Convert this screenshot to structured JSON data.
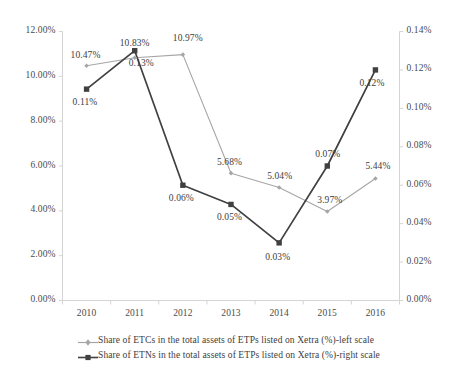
{
  "chart_data": {
    "type": "line",
    "title": "",
    "xlabel": "",
    "ylabel": "",
    "categories": [
      "2010",
      "2011",
      "2012",
      "2013",
      "2014",
      "2015",
      "2016"
    ],
    "grid": false,
    "legend_position": "bottom",
    "axes": {
      "left": {
        "label": "left scale",
        "ylim": [
          0.0,
          12.0
        ],
        "tick_step": 2.0,
        "ticks": [
          "0.00%",
          "2.00%",
          "4.00%",
          "6.00%",
          "8.00%",
          "10.00%",
          "12.00%"
        ]
      },
      "right": {
        "label": "right scale",
        "ylim": [
          0.0,
          0.14
        ],
        "tick_step": 0.02,
        "ticks": [
          "0.00%",
          "0.02%",
          "0.04%",
          "0.06%",
          "0.08%",
          "0.10%",
          "0.12%",
          "0.14%"
        ]
      }
    },
    "series": [
      {
        "name": "Share of ETCs in the total assets of ETPs listed on Xetra (%)-left scale",
        "axis": "left",
        "color": "#a6a6a6",
        "marker": "diamond",
        "values": [
          10.47,
          10.83,
          10.97,
          5.68,
          5.04,
          3.97,
          5.44
        ],
        "labels": [
          "10.47%",
          "10.83%",
          "10.97%",
          "5.68%",
          "5.04%",
          "3.97%",
          "5.44%"
        ]
      },
      {
        "name": "Share of ETNs in the total assets of ETPs listed on Xetra (%)-right scale",
        "axis": "right",
        "color": "#404040",
        "marker": "square",
        "values": [
          0.11,
          0.13,
          0.06,
          0.05,
          0.03,
          0.07,
          0.12
        ],
        "labels": [
          "0.11%",
          "0.13%",
          "0.06%",
          "0.05%",
          "0.03%",
          "0.07%",
          "0.12%"
        ]
      }
    ]
  },
  "legend": {
    "items": [
      {
        "label": "Share of ETCs in the total assets of ETPs listed on Xetra (%)-left scale",
        "color": "#a6a6a6",
        "marker": "diamond"
      },
      {
        "label": "Share of ETNs in the total assets of ETPs listed on Xetra (%)-right scale",
        "color": "#404040",
        "marker": "square"
      }
    ]
  },
  "label_offsets": {
    "etc": [
      {
        "dx": -16,
        "dy": -16
      },
      {
        "dx": -15,
        "dy": -20
      },
      {
        "dx": -10,
        "dy": -22
      },
      {
        "dx": -14,
        "dy": -16
      },
      {
        "dx": -12,
        "dy": -17
      },
      {
        "dx": -10,
        "dy": -17
      },
      {
        "dx": -10,
        "dy": -18
      }
    ],
    "etn": [
      {
        "dx": -14,
        "dy": 8
      },
      {
        "dx": -6,
        "dy": 7
      },
      {
        "dx": -14,
        "dy": 8
      },
      {
        "dx": -14,
        "dy": 8
      },
      {
        "dx": -14,
        "dy": 9
      },
      {
        "dx": -12,
        "dy": -17
      },
      {
        "dx": -16,
        "dy": 8
      }
    ]
  }
}
